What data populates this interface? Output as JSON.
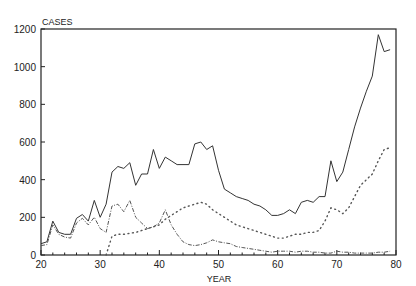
{
  "chart_data": {
    "type": "line",
    "title": "",
    "xlabel": "YEAR",
    "ylabel": "CASES",
    "xlim": [
      20,
      80
    ],
    "ylim": [
      0,
      1200
    ],
    "grid": false,
    "legend": null,
    "x_ticks": [
      20,
      30,
      40,
      50,
      60,
      70,
      80
    ],
    "y_ticks": [
      0,
      200,
      400,
      600,
      800,
      1000,
      1200
    ],
    "x": [
      20,
      21,
      22,
      23,
      24,
      25,
      26,
      27,
      28,
      29,
      30,
      31,
      32,
      33,
      34,
      35,
      36,
      37,
      38,
      39,
      40,
      41,
      42,
      43,
      44,
      45,
      46,
      47,
      48,
      49,
      50,
      51,
      52,
      53,
      54,
      55,
      56,
      57,
      58,
      59,
      60,
      61,
      62,
      63,
      64,
      65,
      66,
      67,
      68,
      69,
      70,
      71,
      72,
      73,
      74,
      75,
      76,
      77,
      78,
      79
    ],
    "series": [
      {
        "name": "total",
        "style": "solid",
        "values": [
          60,
          70,
          180,
          120,
          110,
          110,
          195,
          215,
          180,
          290,
          200,
          270,
          440,
          470,
          460,
          490,
          370,
          430,
          430,
          560,
          460,
          520,
          500,
          480,
          480,
          480,
          590,
          600,
          560,
          580,
          450,
          350,
          330,
          310,
          300,
          290,
          270,
          260,
          240,
          210,
          210,
          220,
          240,
          220,
          280,
          290,
          280,
          310,
          310,
          500,
          390,
          440,
          560,
          680,
          780,
          870,
          950,
          1170,
          1080,
          1090
        ]
      },
      {
        "name": "series-2",
        "style": "dashed",
        "values": [
          50,
          55,
          160,
          110,
          95,
          90,
          170,
          195,
          160,
          200,
          140,
          120,
          260,
          270,
          230,
          290,
          200,
          170,
          140,
          150,
          170,
          240,
          160,
          110,
          70,
          55,
          50,
          55,
          65,
          80,
          70,
          65,
          60,
          45,
          40,
          35,
          30,
          25,
          20,
          15,
          20,
          20,
          20,
          15,
          20,
          20,
          15,
          15,
          10,
          10,
          20,
          15,
          15,
          10,
          10,
          10,
          10,
          15,
          15,
          20
        ]
      },
      {
        "name": "series-3",
        "style": "dotted",
        "values": [
          null,
          null,
          null,
          null,
          null,
          null,
          null,
          null,
          null,
          null,
          null,
          0,
          100,
          110,
          110,
          115,
          120,
          130,
          140,
          150,
          160,
          190,
          210,
          230,
          250,
          260,
          270,
          280,
          270,
          240,
          220,
          200,
          180,
          160,
          150,
          140,
          130,
          120,
          110,
          100,
          90,
          90,
          100,
          110,
          110,
          120,
          120,
          130,
          180,
          250,
          240,
          220,
          250,
          310,
          370,
          400,
          430,
          500,
          560,
          570
        ]
      }
    ]
  },
  "labels": {
    "y_axis_title": "CASES",
    "x_axis_title": "YEAR"
  }
}
